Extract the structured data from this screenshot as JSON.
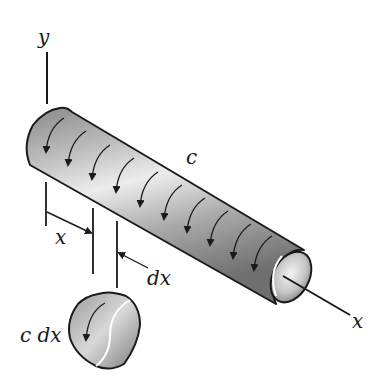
{
  "figure": {
    "type": "diagram",
    "labels": {
      "y_axis": "y",
      "x_axis": "x",
      "distributed_torque": "c",
      "position": "x",
      "element_length": "dx",
      "element_torque": "c dx"
    },
    "colors": {
      "outline": "#1a1a1a",
      "shade_dark": "#7a7a7a",
      "shade_light": "#e6e6e6",
      "background": "#ffffff"
    },
    "torque_arrow_count": 10
  }
}
